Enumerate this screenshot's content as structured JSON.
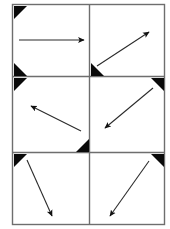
{
  "figure": {
    "title": "",
    "canvas": {
      "width": 170,
      "height": 229,
      "background": "#ffffff"
    },
    "grid": {
      "rows": 3,
      "cols": 2,
      "left": 12.5,
      "top": 4.5,
      "right": 164.5,
      "bottom": 224.5,
      "v_divider_x": 89.5,
      "h_divider_y": [
        76.5,
        152.5
      ],
      "border_color": "#6e6e6e",
      "border_width": 1.4
    },
    "marker": {
      "name": "corner-triangle",
      "color": "#0a0a0a",
      "size": 13
    },
    "cells": [
      {
        "id": "cell-1",
        "label": "top-left",
        "arrow": {
          "name": "arrow-right",
          "direction": "right",
          "x1": 19,
          "y1": 40,
          "x2": 84,
          "y2": 40,
          "color": "#2b2b2b",
          "width": 1.1
        },
        "corners": [
          "top-left",
          "bottom-left"
        ]
      },
      {
        "id": "cell-2",
        "label": "top-right",
        "arrow": {
          "name": "arrow-up-right",
          "direction": "up-right",
          "x1": 97,
          "y1": 66,
          "x2": 149,
          "y2": 32,
          "color": "#2b2b2b",
          "width": 1.1
        },
        "corners": [
          "bottom-left"
        ]
      },
      {
        "id": "cell-3",
        "label": "middle-left",
        "arrow": {
          "name": "arrow-up-left",
          "direction": "up-left",
          "x1": 81,
          "y1": 131,
          "x2": 31,
          "y2": 106,
          "color": "#2b2b2b",
          "width": 1.1
        },
        "corners": [
          "top-left",
          "bottom-right"
        ]
      },
      {
        "id": "cell-4",
        "label": "middle-right",
        "arrow": {
          "name": "arrow-down-left",
          "direction": "down-left",
          "x1": 153,
          "y1": 88,
          "x2": 105,
          "y2": 128,
          "color": "#2b2b2b",
          "width": 1.1
        },
        "corners": [
          "top-right"
        ]
      },
      {
        "id": "cell-5",
        "label": "bottom-left",
        "arrow": {
          "name": "arrow-down-right",
          "direction": "down-right",
          "x1": 27,
          "y1": 160,
          "x2": 52,
          "y2": 216,
          "color": "#2b2b2b",
          "width": 1.1
        },
        "corners": [
          "top-left"
        ]
      },
      {
        "id": "cell-6",
        "label": "bottom-right",
        "arrow": {
          "name": "arrow-down-left",
          "direction": "down-left",
          "x1": 149,
          "y1": 161,
          "x2": 110,
          "y2": 216,
          "color": "#2b2b2b",
          "width": 1.1
        },
        "corners": [
          "top-right"
        ]
      }
    ]
  }
}
